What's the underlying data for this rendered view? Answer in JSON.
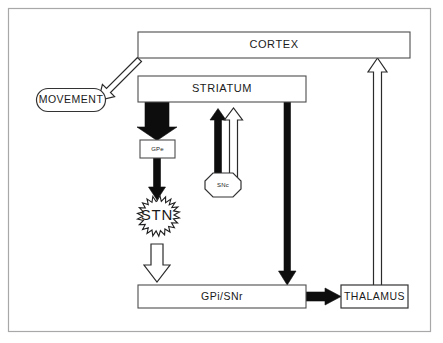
{
  "diagram": {
    "frame": {
      "name": "outer-border"
    },
    "nodes": {
      "cortex": {
        "label": "CORTEX",
        "shape": "rectangle"
      },
      "movement": {
        "label": "MOVEMENT",
        "shape": "rounded-rectangle"
      },
      "striatum": {
        "label": "STRIATUM",
        "shape": "rectangle"
      },
      "gpe": {
        "label": "GPe",
        "shape": "rectangle"
      },
      "stn": {
        "label": "STN",
        "shape": "starburst-circle"
      },
      "snc": {
        "label": "SNc",
        "shape": "octagon"
      },
      "gpi_snr": {
        "label": "GPi/SNr",
        "shape": "rectangle"
      },
      "thalamus": {
        "label": "THALAMUS",
        "shape": "rectangle"
      }
    },
    "connections": [
      {
        "id": "cortex-to-movement",
        "from": "cortex",
        "to": "movement",
        "style": "hollow",
        "direction": "down-left"
      },
      {
        "id": "striatum-to-gpe",
        "from": "striatum",
        "to": "gpe",
        "style": "filled-thick",
        "direction": "down"
      },
      {
        "id": "gpe-to-stn",
        "from": "gpe",
        "to": "stn",
        "style": "filled-thin",
        "direction": "down"
      },
      {
        "id": "stn-to-gpi-snr",
        "from": "stn",
        "to": "gpi_snr",
        "style": "hollow",
        "direction": "down"
      },
      {
        "id": "snc-to-striatum-inhibitory",
        "from": "snc",
        "to": "striatum",
        "style": "filled-thin",
        "direction": "up"
      },
      {
        "id": "snc-to-striatum-excitatory",
        "from": "snc",
        "to": "striatum",
        "style": "hollow",
        "direction": "up"
      },
      {
        "id": "striatum-to-gpi-snr",
        "from": "striatum",
        "to": "gpi_snr",
        "style": "filled-thin",
        "direction": "down"
      },
      {
        "id": "gpi-snr-to-thalamus",
        "from": "gpi_snr",
        "to": "thalamus",
        "style": "filled-thick",
        "direction": "right"
      },
      {
        "id": "thalamus-to-cortex",
        "from": "thalamus",
        "to": "cortex",
        "style": "hollow",
        "direction": "up"
      }
    ],
    "colors": {
      "background": "#ffffff",
      "frame_stroke": "#a8a8a8",
      "box_stroke": "#4d4d4d",
      "filled_arrow": "#0d0d0d",
      "hollow_arrow_stroke": "#2b2b2b",
      "text": "#1a1a1a"
    }
  }
}
